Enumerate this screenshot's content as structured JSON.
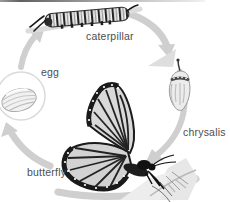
{
  "diagram": {
    "name": "butterfly life cycle",
    "type": "cycle-diagram",
    "stages": [
      {
        "id": "caterpillar",
        "label": "caterpillar"
      },
      {
        "id": "chrysalis",
        "label": "chrysalis"
      },
      {
        "id": "butterfly",
        "label": "butterfly"
      },
      {
        "id": "egg",
        "label": "egg"
      }
    ],
    "illustrations": [
      "caterpillar-icon",
      "chrysalis-icon",
      "butterfly-icon",
      "egg-icon",
      "cycle-arrow-icon"
    ],
    "colors": {
      "background": "#ffffff",
      "arrow": "#cfcfcf",
      "label": "#4d4d4d",
      "art_dark": "#1c1c1c",
      "art_light": "#e6e6e6"
    }
  }
}
